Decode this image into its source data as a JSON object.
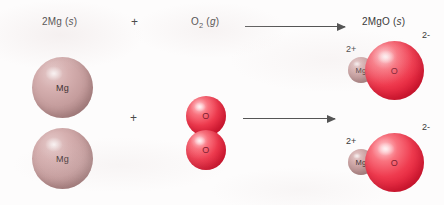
{
  "diagram": {
    "equation_labels": {
      "reactant_metal": {
        "coefficient": "2",
        "formula": "Mg",
        "state": "(s)",
        "full": "2Mg (s)"
      },
      "reactant_gas": {
        "coefficient": "",
        "formula": "O2",
        "state": "(g)",
        "full": "O2 (g)"
      },
      "product": {
        "coefficient": "2",
        "formula": "MgO",
        "state": "(s)",
        "full": "2MgO (s)"
      }
    },
    "operators": {
      "plus_top": "+",
      "plus_bottom": "+"
    },
    "arrows": [
      {
        "name": "reaction-arrow-top",
        "direction": "right"
      },
      {
        "name": "reaction-arrow-bottom",
        "direction": "right"
      }
    ],
    "reactant_magnesium_atoms": [
      {
        "symbol": "Mg",
        "charge": ""
      },
      {
        "symbol": "Mg",
        "charge": ""
      }
    ],
    "reactant_oxygen_molecule": {
      "name": "O2",
      "atoms": [
        {
          "symbol": "O"
        },
        {
          "symbol": "O"
        }
      ]
    },
    "product_formula_units": [
      {
        "cation": {
          "symbol": "Mg",
          "charge": "2+"
        },
        "anion": {
          "symbol": "O",
          "charge": "2-"
        }
      },
      {
        "cation": {
          "symbol": "Mg",
          "charge": "2+"
        },
        "anion": {
          "symbol": "O",
          "charge": "2-"
        }
      }
    ],
    "colors": {
      "magnesium_atom": "#c59d9d",
      "magnesium_ion": "#b99595",
      "oxygen": "#ef3b4f",
      "text": "#3a3a3a",
      "arrow": "#555555",
      "background": "#fdfcfc"
    }
  }
}
